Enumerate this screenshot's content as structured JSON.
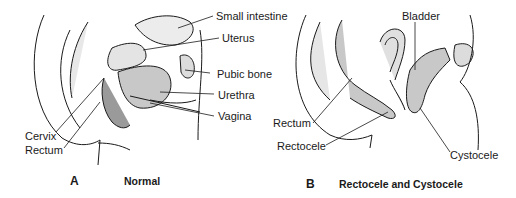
{
  "panels": [
    {
      "letter": "A",
      "caption": "Normal",
      "labels": {
        "small_intestine": "Small intestine",
        "uterus": "Uterus",
        "pubic_bone": "Pubic bone",
        "urethra": "Urethra",
        "vagina": "Vagina",
        "cervix": "Cervix",
        "rectum": "Rectum"
      }
    },
    {
      "letter": "B",
      "caption": "Rectocele and Cystocele",
      "labels": {
        "bladder": "Bladder",
        "rectum": "Rectum",
        "rectocele": "Rectocele",
        "cystocele": "Cystocele"
      }
    }
  ],
  "colors": {
    "line": "#1a1a1a",
    "shade": "#c8c8c8",
    "dark_shade": "#8f8f8f"
  }
}
